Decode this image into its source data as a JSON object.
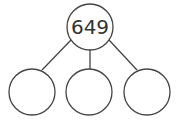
{
  "diagram": {
    "type": "number-bond",
    "stroke_color": "#444444",
    "root": {
      "label": "649"
    },
    "children": [
      {
        "label": ""
      },
      {
        "label": ""
      },
      {
        "label": ""
      }
    ]
  }
}
